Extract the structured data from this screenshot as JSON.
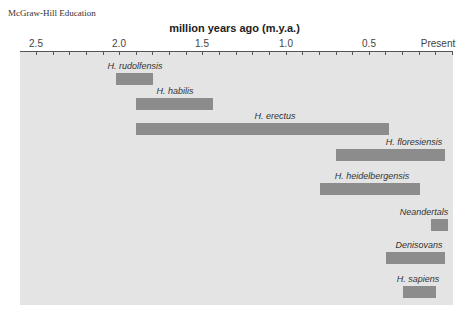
{
  "publisher": "McGraw-Hill Education",
  "chart_data": {
    "type": "bar",
    "orientation": "horizontal-range",
    "title": "million years ago (m.y.a.)",
    "xlabel": "million years ago (m.y.a.)",
    "ylabel": "",
    "xlim": [
      2.5,
      0.0
    ],
    "x_ticks": [
      "2.5",
      "2.0",
      "1.5",
      "1.0",
      "0.5",
      "Present"
    ],
    "minor_tick_interval": 0.1,
    "grid": false,
    "legend": null,
    "categories": [
      "H. rudolfensis",
      "H. habilis",
      "H. erectus",
      "H. floresiensis",
      "H. heidelbergensis",
      "Neandertals",
      "Denisovans",
      "H. sapiens"
    ],
    "series": [
      {
        "name": "time range (m.y.a.)",
        "ranges": [
          {
            "label": "H. rudolfensis",
            "start": 2.0,
            "end": 1.8
          },
          {
            "label": "H. habilis",
            "start": 1.9,
            "end": 1.45
          },
          {
            "label": "H. erectus",
            "start": 1.9,
            "end": 0.4
          },
          {
            "label": "H. floresiensis",
            "start": 0.7,
            "end": 0.05
          },
          {
            "label": "H. heidelbergensis",
            "start": 0.8,
            "end": 0.2
          },
          {
            "label": "Neandertals",
            "start": 0.13,
            "end": 0.03
          },
          {
            "label": "Denisovans",
            "start": 0.4,
            "end": 0.05
          },
          {
            "label": "H. sapiens",
            "start": 0.3,
            "end": 0.1
          }
        ]
      }
    ]
  },
  "axis": {
    "title": "million years ago (m.y.a.)",
    "labels": [
      {
        "text": "2.5",
        "x": 36
      },
      {
        "text": "2.0",
        "x": 119
      },
      {
        "text": "1.5",
        "x": 202
      },
      {
        "text": "1.0",
        "x": 286
      },
      {
        "text": "0.5",
        "x": 369
      },
      {
        "text": "Present",
        "x": 438
      }
    ]
  },
  "bars": [
    {
      "label": "H. rudolfensis",
      "x": 116,
      "w": 37,
      "y": 73,
      "lx": 130,
      "ly": 61
    },
    {
      "label": "H. habilis",
      "x": 136,
      "w": 77,
      "y": 98,
      "lx": 175,
      "ly": 86
    },
    {
      "label": "H. erectus",
      "x": 136,
      "w": 253,
      "y": 123,
      "lx": 275,
      "ly": 112
    },
    {
      "label": "H. floresiensis",
      "x": 336,
      "w": 109,
      "y": 149,
      "lx": 414,
      "ly": 137
    },
    {
      "label": "H. heidelbergensis",
      "x": 320,
      "w": 100,
      "y": 183,
      "lx": 372,
      "ly": 171
    },
    {
      "label": "Neandertals",
      "x": 431,
      "w": 17,
      "y": 219,
      "lx": 424,
      "ly": 207
    },
    {
      "label": "Denisovans",
      "x": 386,
      "w": 59,
      "y": 252,
      "lx": 419,
      "ly": 240
    },
    {
      "label": "H. sapiens",
      "x": 403,
      "w": 33,
      "y": 286,
      "lx": 418,
      "ly": 274
    }
  ],
  "colors": {
    "panel": "#e4e4e4",
    "bar": "#8c8c8c",
    "axis": "#555555"
  }
}
